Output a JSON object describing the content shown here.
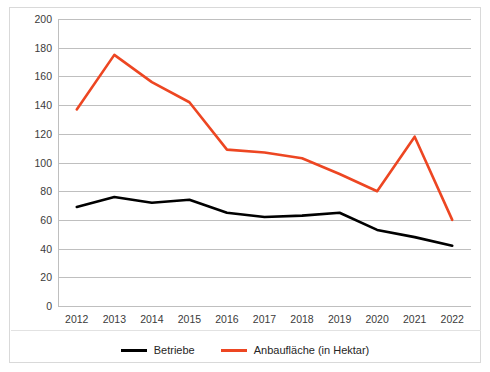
{
  "chart_data": {
    "type": "line",
    "title": "",
    "xlabel": "",
    "ylabel": "",
    "categories": [
      "2012",
      "2013",
      "2014",
      "2015",
      "2016",
      "2017",
      "2018",
      "2019",
      "2020",
      "2021",
      "2022"
    ],
    "ylim": [
      0,
      200
    ],
    "y_ticks": [
      0,
      20,
      40,
      60,
      80,
      100,
      120,
      140,
      160,
      180,
      200
    ],
    "grid": "horizontal",
    "legend_position": "bottom-center",
    "series": [
      {
        "name": "Betriebe",
        "color": "#000000",
        "values": [
          69,
          76,
          72,
          74,
          65,
          62,
          63,
          65,
          53,
          48,
          42
        ]
      },
      {
        "name": "Anbaufläche (in Hektar)",
        "color": "#ED4622",
        "values": [
          137,
          175,
          156,
          142,
          109,
          107,
          103,
          92,
          80,
          118,
          60
        ]
      }
    ]
  },
  "legend": {
    "items": [
      {
        "label": "Betriebe",
        "color": "#000000"
      },
      {
        "label": "Anbaufläche (in Hektar)",
        "color": "#ED4622"
      }
    ]
  },
  "colors": {
    "betriebe": "#000000",
    "anbauflaeche": "#ED4622",
    "gridline": "#bfbfbf",
    "frame": "#d9d9d9",
    "tick_text": "#3b3b3b"
  }
}
